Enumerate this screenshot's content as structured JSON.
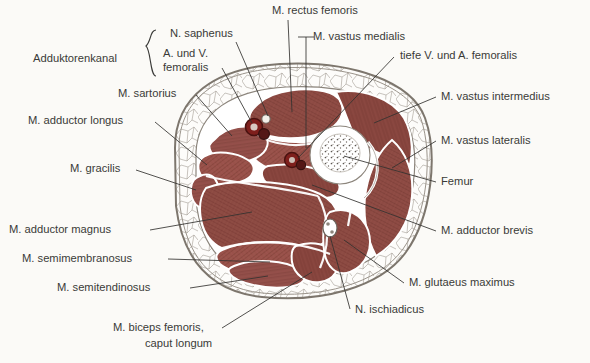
{
  "figure": {
    "title_alt": "Querschnitt durch den Oberschenkel",
    "background_color": "#fbfaf7",
    "ink_color": "#3a3a38",
    "muscle_color": "#8d4a43",
    "muscle_color_dark": "#7a3b35",
    "muscle_color_light": "#9e5a51",
    "fat_color": "#fdfcfa",
    "bone_color": "#ffffff",
    "vessel_color": "#7e1f1c",
    "fascia_color": "#8c857c"
  },
  "bracket": {
    "label": "Adduktorenkanal",
    "glyph": "brace-left",
    "covers": [
      "N. saphenus",
      "A. und V. femoralis"
    ]
  },
  "labels": {
    "left": [
      {
        "id": "n-saphenus",
        "text": "N. saphenus",
        "x": 170,
        "y": 37
      },
      {
        "id": "a-v-femoralis-1",
        "text": "A. und V.",
        "x": 163,
        "y": 57
      },
      {
        "id": "a-v-femoralis-2",
        "text": "femoralis",
        "x": 163,
        "y": 71
      },
      {
        "id": "adduktorenkanal",
        "text": "Adduktorenkanal",
        "x": 33,
        "y": 62
      },
      {
        "id": "m-sartorius",
        "text": "M. sartorius",
        "x": 118,
        "y": 97
      },
      {
        "id": "m-adductor-longus",
        "text": "M. adductor longus",
        "x": 28,
        "y": 124
      },
      {
        "id": "m-gracilis",
        "text": "M. gracilis",
        "x": 70,
        "y": 172
      },
      {
        "id": "m-adductor-magnus",
        "text": "M. adductor magnus",
        "x": 9,
        "y": 233
      },
      {
        "id": "m-semimembranosus",
        "text": "M. semimembranosus",
        "x": 22,
        "y": 262
      },
      {
        "id": "m-semitendinosus",
        "text": "M. semitendinosus",
        "x": 57,
        "y": 291
      },
      {
        "id": "m-biceps-1",
        "text": "M. biceps femoris,",
        "x": 113,
        "y": 331
      },
      {
        "id": "m-biceps-2",
        "text": "caput longum",
        "x": 145,
        "y": 347
      }
    ],
    "top": [
      {
        "id": "m-rectus-femoris",
        "text": "M. rectus femoris",
        "x": 272,
        "y": 14
      },
      {
        "id": "m-vastus-medialis",
        "text": "M. vastus medialis",
        "x": 313,
        "y": 40
      },
      {
        "id": "tiefe-v-a-femoralis",
        "text": "tiefe V. und A. femoralis",
        "x": 400,
        "y": 59
      }
    ],
    "right": [
      {
        "id": "m-vastus-intermedius",
        "text": "M. vastus intermedius",
        "x": 441,
        "y": 100
      },
      {
        "id": "m-vastus-lateralis",
        "text": "M. vastus lateralis",
        "x": 441,
        "y": 144
      },
      {
        "id": "femur",
        "text": "Femur",
        "x": 441,
        "y": 185
      },
      {
        "id": "m-adductor-brevis",
        "text": "M. adductor brevis",
        "x": 441,
        "y": 234
      },
      {
        "id": "m-glutaeus-maximus",
        "text": "M. glutaeus maximus",
        "x": 409,
        "y": 286
      },
      {
        "id": "n-ischiadicus",
        "text": "N. ischiadicus",
        "x": 355,
        "y": 313
      }
    ]
  },
  "structures": [
    {
      "name": "skin-and-fascia-envelope",
      "kind": "outline"
    },
    {
      "name": "subcutaneous-fat-layer",
      "kind": "fat"
    },
    {
      "name": "m-sartorius",
      "kind": "muscle"
    },
    {
      "name": "m-adductor-longus",
      "kind": "muscle"
    },
    {
      "name": "m-gracilis",
      "kind": "muscle"
    },
    {
      "name": "m-adductor-magnus",
      "kind": "muscle"
    },
    {
      "name": "m-adductor-brevis",
      "kind": "muscle"
    },
    {
      "name": "m-rectus-femoris",
      "kind": "muscle"
    },
    {
      "name": "m-vastus-medialis",
      "kind": "muscle"
    },
    {
      "name": "m-vastus-intermedius",
      "kind": "muscle"
    },
    {
      "name": "m-vastus-lateralis",
      "kind": "muscle"
    },
    {
      "name": "m-semimembranosus",
      "kind": "muscle"
    },
    {
      "name": "m-semitendinosus",
      "kind": "muscle"
    },
    {
      "name": "m-biceps-femoris-caput-longum",
      "kind": "muscle"
    },
    {
      "name": "m-glutaeus-maximus",
      "kind": "muscle"
    },
    {
      "name": "femur",
      "kind": "bone"
    },
    {
      "name": "a-und-v-femoralis",
      "kind": "vessel"
    },
    {
      "name": "tiefe-v-und-a-femoralis",
      "kind": "vessel"
    },
    {
      "name": "n-saphenus",
      "kind": "nerve"
    },
    {
      "name": "n-ischiadicus",
      "kind": "nerve"
    }
  ]
}
